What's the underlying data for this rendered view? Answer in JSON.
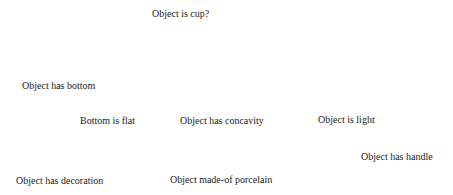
{
  "diagram": {
    "nodes": [
      {
        "id": "cup",
        "label": "Object is cup?"
      },
      {
        "id": "bottom",
        "label": "Object has bottom"
      },
      {
        "id": "flat",
        "label": "Bottom is flat"
      },
      {
        "id": "concavity",
        "label": "Object has concavity"
      },
      {
        "id": "light",
        "label": "Object is light"
      },
      {
        "id": "handle",
        "label": "Object has handle"
      },
      {
        "id": "decoration",
        "label": "Object has decoration"
      },
      {
        "id": "porcelain",
        "label": "Object made-of porcelain"
      }
    ]
  }
}
